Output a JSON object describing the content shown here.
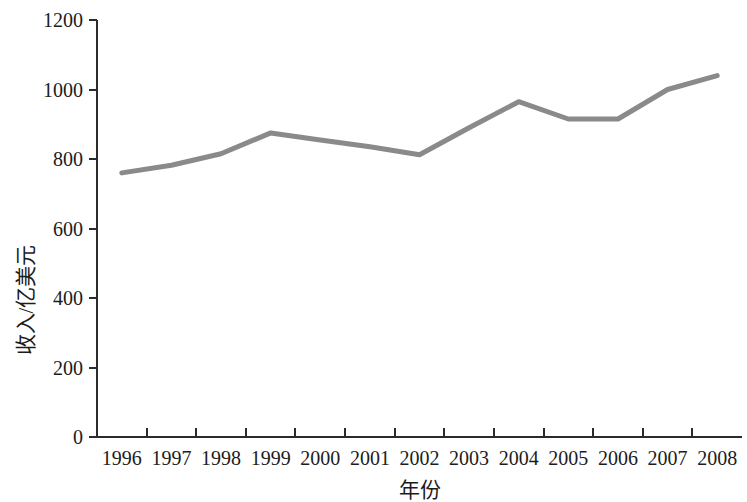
{
  "chart_data": {
    "type": "line",
    "title": "",
    "subtitle": "",
    "xlabel": "年份",
    "ylabel": "收入/亿美元",
    "categories": [
      "1996",
      "1997",
      "1998",
      "1999",
      "2000",
      "2001",
      "2002",
      "2003",
      "2004",
      "2005",
      "2006",
      "2007",
      "2008"
    ],
    "x": [
      1996,
      1997,
      1998,
      1999,
      2000,
      2001,
      2002,
      2003,
      2004,
      2005,
      2006,
      2007,
      2008
    ],
    "values": [
      760,
      782,
      815,
      875,
      855,
      835,
      812,
      890,
      965,
      915,
      915,
      1000,
      1040
    ],
    "series": [
      {
        "name": "收入",
        "values": [
          760,
          782,
          815,
          875,
          855,
          835,
          812,
          890,
          965,
          915,
          915,
          1000,
          1040
        ]
      }
    ],
    "ylim": [
      0,
      1200
    ],
    "yticks": [
      0,
      200,
      400,
      600,
      800,
      1000,
      1200
    ],
    "ytick_labels": [
      "0",
      "200",
      "400",
      "600",
      "800",
      "1000",
      "1200"
    ],
    "xtick_labels": [
      "1996",
      "1997",
      "1998",
      "1999",
      "2000",
      "2001",
      "2002",
      "2003",
      "2004",
      "2005",
      "2006",
      "2007",
      "2008"
    ],
    "grid": false,
    "legend": false,
    "legend_position": "none",
    "line_color": "#8a8a8a",
    "axis_color": "#2b2b2b",
    "background_color": "#ffffff",
    "line_width": 5
  },
  "axes": {
    "y_title": "收入/亿美元",
    "x_title": "年份"
  }
}
